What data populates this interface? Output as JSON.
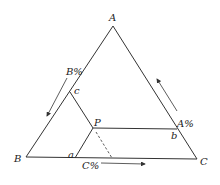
{
  "diagram": {
    "type": "ternary-phase-diagram",
    "vertices": {
      "A": {
        "label": "A"
      },
      "B": {
        "label": "B"
      },
      "C": {
        "label": "C"
      }
    },
    "axis_labels": {
      "A": "A%",
      "B": "B%",
      "C": "C%"
    },
    "points": {
      "P": "P",
      "a": "a",
      "b": "b",
      "c": "c"
    },
    "colors": {
      "line": "#333333",
      "text": "#222222",
      "background": "#ffffff"
    }
  }
}
